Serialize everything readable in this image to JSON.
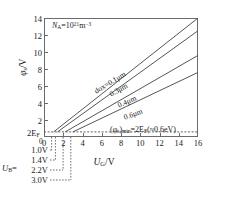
{
  "chart_data": {
    "type": "line",
    "title": "",
    "xlabel": "U_G/V",
    "ylabel": "φ_s/V",
    "xlim": [
      0,
      16
    ],
    "ylim": [
      0,
      14
    ],
    "xticks": [
      0,
      2,
      4,
      6,
      8,
      10,
      12,
      14,
      16
    ],
    "yticks": [
      2,
      4,
      6,
      8,
      10,
      12,
      14
    ],
    "grid": false,
    "legend_position": "inline-curve-labels",
    "series": [
      {
        "name": "dox=0.1μm",
        "x": [
          1.0,
          16
        ],
        "y": [
          0.6,
          14.0
        ]
      },
      {
        "name": "0.3μm",
        "x": [
          1.4,
          16
        ],
        "y": [
          0.6,
          12.5
        ]
      },
      {
        "name": "0.4μm",
        "x": [
          2.2,
          16
        ],
        "y": [
          0.6,
          9.6
        ]
      },
      {
        "name": "0.6μm",
        "x": [
          3.0,
          16
        ],
        "y": [
          0.6,
          7.6
        ]
      }
    ],
    "threshold_line": {
      "label": "(φ_s)_min",
      "value": 0.6
    },
    "annotations": [
      "N_A=10^21 m^-3",
      "(φ_s)_min=2E_F(≈0.6eV)",
      "2E_F"
    ]
  },
  "axis": {
    "y_ticks": [
      "14",
      "12",
      "10",
      "8",
      "6",
      "4",
      "2"
    ],
    "x_ticks": [
      "0",
      "2",
      "4",
      "6",
      "8",
      "10",
      "12",
      "14",
      "16"
    ],
    "y_title_main": "φ",
    "y_title_sub": "s",
    "y_title_unit": "/V",
    "x_title_main": "U",
    "x_title_sub": "G",
    "x_title_unit": "/V"
  },
  "annotations": {
    "doping_main": "N",
    "doping_sub": "A",
    "doping_eq": "=10",
    "doping_exp": "21",
    "doping_unit": "m",
    "doping_unit_exp": "−3",
    "min_open": "(φ",
    "min_sub1": "s",
    "min_mid": ")",
    "min_sub2": "min",
    "min_eq": "=2E",
    "min_sub3": "F",
    "min_tail": "(≈0.6eV)",
    "twoef_main": "2E",
    "twoef_sub": "F",
    "zero_label": "0"
  },
  "curve_labels": [
    {
      "text": "dox=0.1μm",
      "left": 95,
      "top": 87,
      "angle": -31
    },
    {
      "text": "0.3μm",
      "left": 110,
      "top": 90,
      "angle": -29
    },
    {
      "text": "0.4μm",
      "left": 118,
      "top": 101,
      "angle": -24
    },
    {
      "text": "0.6μm",
      "left": 124,
      "top": 113,
      "angle": -20
    }
  ],
  "legend": {
    "tag_main": "U",
    "tag_sub": "B",
    "tag_eq": "=",
    "rows": [
      {
        "value": "1.0V",
        "top": 146,
        "dash_x": 51.6
      },
      {
        "value": "1.4V",
        "top": 156,
        "dash_x": 55.4
      },
      {
        "value": "2.2V",
        "top": 166,
        "dash_x": 63.1
      },
      {
        "value": "3.0V",
        "top": 176,
        "dash_x": 70.8
      }
    ]
  },
  "colors": {
    "frame": "#6b6b6b",
    "curve": "#555555",
    "dashed": "#4d4d4d",
    "text": "#1a1a1a",
    "background": "#ffffff"
  }
}
